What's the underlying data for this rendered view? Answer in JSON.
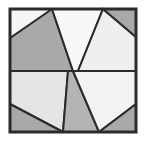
{
  "figure": {
    "type": "polygon-tiling",
    "canvas": {
      "width": 146,
      "height": 141
    },
    "frame": {
      "name": "outer-square-border",
      "x": 10,
      "y": 9,
      "width": 126,
      "height": 123,
      "stroke": "#2b2b2b",
      "stroke_width": 3,
      "fill": "none"
    },
    "midline": {
      "name": "horizontal-center-line",
      "x1": 10,
      "y1": 71,
      "x2": 136,
      "y2": 71,
      "stroke": "#2b2b2b"
    },
    "center_point": {
      "x": 73,
      "y": 71
    },
    "palette": {
      "dark_gray": "#a9a9a9",
      "medium_gray": "#b8b8b8",
      "light_gray": "#dedede",
      "pale_gray": "#ededed",
      "near_white": "#f5f5f5",
      "outline": "#2b2b2b",
      "background": "#ffffff"
    },
    "regions": [
      {
        "name": "top-left-dark-quad",
        "shade_label": "dark_gray",
        "fill": "#a9a9a9",
        "points": "10,9 52,9 73,71 10,71"
      },
      {
        "name": "top-left-white-wedge",
        "shade_label": "near_white",
        "fill": "#f5f5f5",
        "points": "10,9 52,9 10,38"
      },
      {
        "name": "top-center-white-quad",
        "shade_label": "near_white",
        "fill": "#f8f8f8",
        "points": "52,9 103,9 78,71 73,71"
      },
      {
        "name": "top-right-light-quad",
        "shade_label": "pale_gray",
        "fill": "#efefef",
        "points": "103,9 136,37 136,71 78,71"
      },
      {
        "name": "top-right-dark-corner",
        "shade_label": "dark_gray",
        "fill": "#a9a9a9",
        "points": "103,9 136,9 136,37"
      },
      {
        "name": "bottom-left-light-quad",
        "shade_label": "pale_gray",
        "fill": "#e4e4e4",
        "points": "10,71 68,71 63,132 10,104"
      },
      {
        "name": "bottom-left-dark-corner",
        "shade_label": "dark_gray",
        "fill": "#a9a9a9",
        "points": "10,104 63,132 10,132"
      },
      {
        "name": "bottom-center-medium-quad",
        "shade_label": "medium_gray",
        "fill": "#b4b4b4",
        "points": "68,71 73,71 99,132 63,132"
      },
      {
        "name": "bottom-right-white-quad",
        "shade_label": "near_white",
        "fill": "#f2f2f2",
        "points": "73,71 136,71 136,104 99,132"
      },
      {
        "name": "bottom-right-dark-corner",
        "shade_label": "dark_gray",
        "fill": "#a9a9a9",
        "points": "136,104 136,132 99,132"
      }
    ]
  }
}
